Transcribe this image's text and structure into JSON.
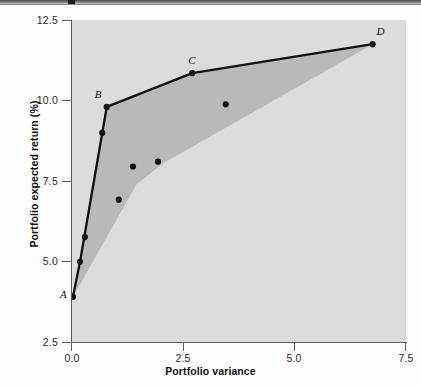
{
  "chart_data": {
    "type": "scatter",
    "title": "",
    "xlabel": "Portfolio variance",
    "ylabel": "Portfolio expected return (%)",
    "xlim": [
      0.0,
      7.5
    ],
    "ylim": [
      2.5,
      12.5
    ],
    "xticks": [
      "0.0",
      "2.5",
      "5.0",
      "7.5"
    ],
    "xtick_values": [
      0.0,
      2.5,
      5.0,
      7.5
    ],
    "yticks": [
      "12.5",
      "10.0",
      "7.5",
      "5.0",
      "2.5"
    ],
    "ytick_values": [
      12.5,
      10.0,
      7.5,
      5.0,
      2.5
    ],
    "grid": false,
    "legend": "none",
    "series": [
      {
        "name": "Efficient frontier",
        "type": "line",
        "marker": "filled-circle",
        "color": "#111111",
        "points": [
          {
            "label": "A",
            "x": 0.02,
            "y": 3.9,
            "label_pos": "left"
          },
          {
            "label": "",
            "x": 0.18,
            "y": 4.99,
            "label_pos": ""
          },
          {
            "label": "",
            "x": 0.68,
            "y": 9.0,
            "label_pos": ""
          },
          {
            "label": "B",
            "x": 0.78,
            "y": 9.8,
            "label_pos": "above-left"
          },
          {
            "label": "C",
            "x": 2.7,
            "y": 10.85,
            "label_pos": "above-left"
          },
          {
            "label": "D",
            "x": 6.75,
            "y": 11.75,
            "label_pos": "above-right"
          }
        ]
      },
      {
        "name": "Individual portfolios",
        "type": "scatter",
        "marker": "filled-circle",
        "color": "#111111",
        "points": [
          {
            "x": 0.29,
            "y": 5.76
          },
          {
            "x": 1.05,
            "y": 6.92
          },
          {
            "x": 1.37,
            "y": 7.95
          },
          {
            "x": 1.93,
            "y": 8.1
          },
          {
            "x": 3.45,
            "y": 9.88
          }
        ]
      }
    ],
    "shaded_region": {
      "name": "feasible set",
      "fill": "#b9b9b9",
      "boundary": [
        {
          "x": 0.02,
          "y": 3.9
        },
        {
          "x": 0.18,
          "y": 4.99
        },
        {
          "x": 0.68,
          "y": 9.0
        },
        {
          "x": 0.78,
          "y": 9.8
        },
        {
          "x": 2.7,
          "y": 10.85
        },
        {
          "x": 6.75,
          "y": 11.75
        },
        {
          "x": 2.05,
          "y": 8.05
        },
        {
          "x": 1.45,
          "y": 7.4
        }
      ]
    },
    "plot_background": "#dcdcdc",
    "axis_color": "#5d5d5d"
  },
  "axes": {
    "x_title": "Portfolio variance",
    "y_title": "Portfolio expected return (%)",
    "x_tick_labels": [
      "0.0",
      "2.5",
      "5.0",
      "7.5"
    ],
    "y_tick_labels": [
      "12.5",
      "10.0",
      "7.5",
      "5.0",
      "2.5"
    ]
  },
  "point_labels": {
    "a": "A",
    "b": "B",
    "c": "C",
    "d": "D"
  }
}
